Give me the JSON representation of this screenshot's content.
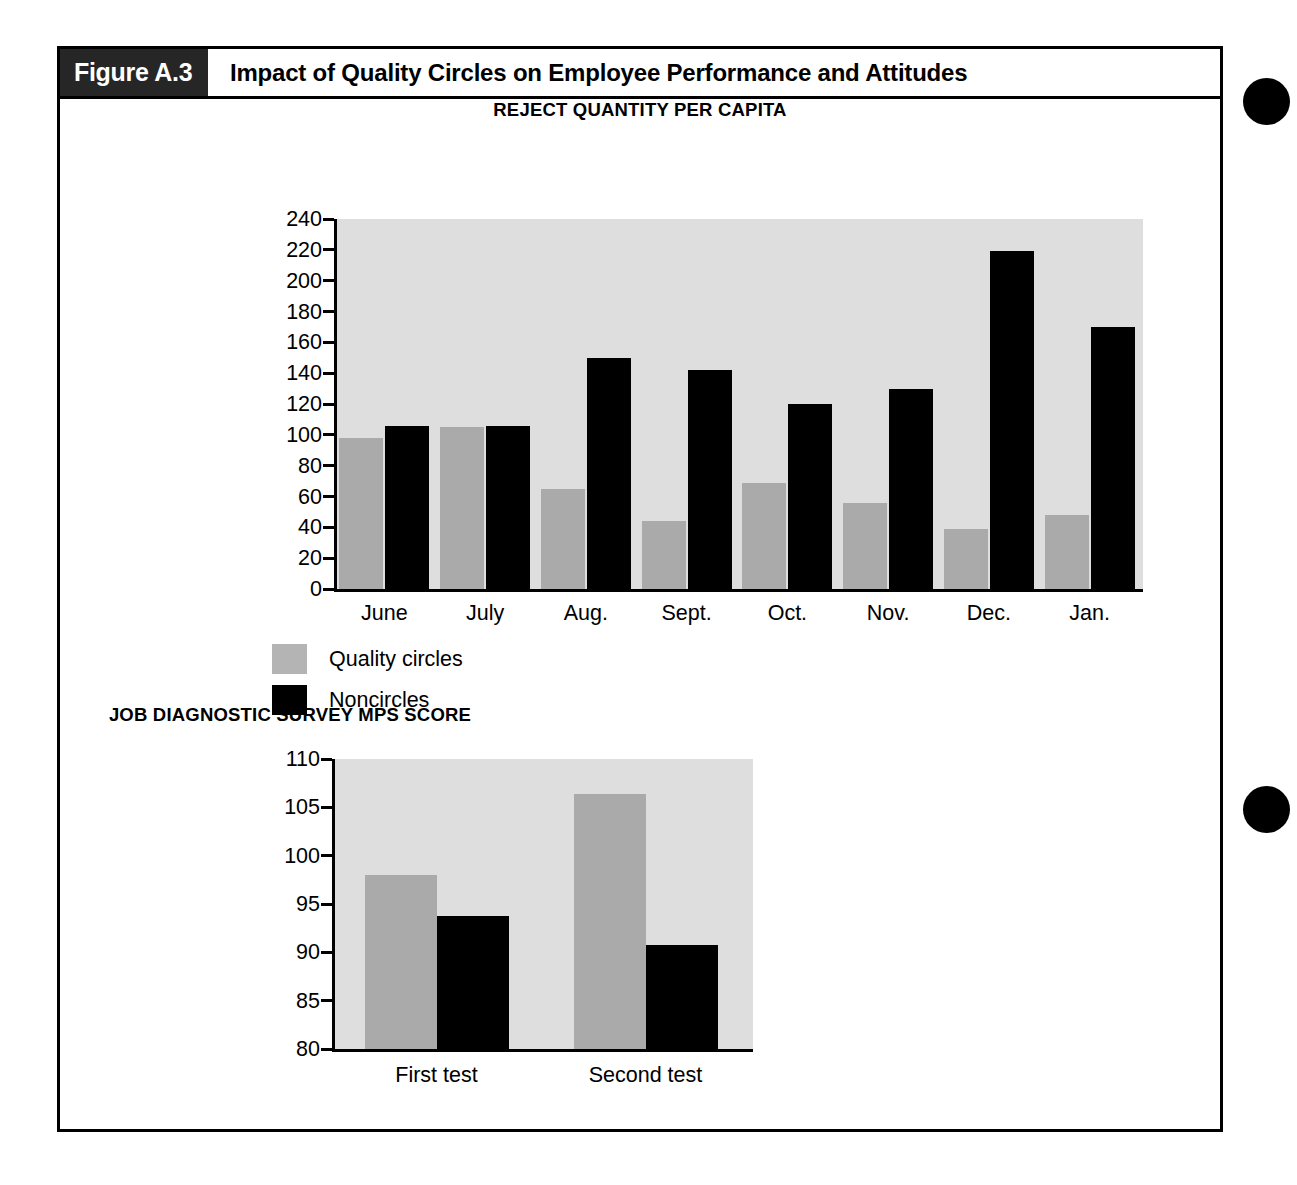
{
  "figure": {
    "number": "Figure A.3",
    "title": "Impact of Quality Circles on Employee Performance and Attitudes"
  },
  "page_marks": {
    "dot_1_name": "page-thumb-dot",
    "dot_2_name": "page-thumb-dot"
  },
  "legend": {
    "items": [
      {
        "label": "Quality circles",
        "color": "#b4b4b4"
      },
      {
        "label": "Noncircles",
        "color": "#000000"
      }
    ]
  },
  "chart_data": [
    {
      "type": "bar",
      "title": "REJECT QUANTITY PER CAPITA",
      "xlabel": "",
      "ylabel": "",
      "ylim": [
        0,
        240
      ],
      "yticks": [
        0,
        20,
        40,
        60,
        80,
        100,
        120,
        140,
        160,
        180,
        200,
        220,
        240
      ],
      "grid": false,
      "legend_position": "below-left",
      "categories": [
        "June",
        "July",
        "Aug.",
        "Sept.",
        "Oct.",
        "Nov.",
        "Dec.",
        "Jan."
      ],
      "series": [
        {
          "name": "Quality circles",
          "color": "#aaaaaa",
          "values": [
            98,
            105,
            65,
            44,
            69,
            56,
            39,
            48
          ]
        },
        {
          "name": "Noncircles",
          "color": "#000000",
          "values": [
            106,
            106,
            150,
            142,
            120,
            130,
            219,
            170
          ]
        }
      ]
    },
    {
      "type": "bar",
      "title": "JOB DIAGNOSTIC SURVEY MPS SCORE",
      "xlabel": "",
      "ylabel": "",
      "ylim": [
        80,
        110
      ],
      "yticks": [
        80,
        85,
        90,
        95,
        100,
        105,
        110
      ],
      "grid": false,
      "legend_position": "none",
      "categories": [
        "First test",
        "Second test"
      ],
      "series": [
        {
          "name": "Quality circles",
          "color": "#aaaaaa",
          "values": [
            98.0,
            106.4
          ]
        },
        {
          "name": "Noncircles",
          "color": "#000000",
          "values": [
            93.8,
            90.8
          ]
        }
      ]
    }
  ]
}
